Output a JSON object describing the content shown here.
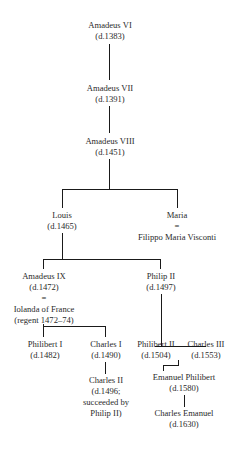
{
  "diagram": {
    "type": "family-tree",
    "nodes": {
      "amadeus_vi": {
        "name": "Amadeus VI",
        "detail": "(d.1383)"
      },
      "amadeus_vii": {
        "name": "Amadeus VII",
        "detail": "(d.1391)"
      },
      "amadeus_viii": {
        "name": "Amadeus VIII",
        "detail": "(d.1451)"
      },
      "louis": {
        "name": "Louis",
        "detail": "(d.1465)"
      },
      "maria": {
        "name": "Maria",
        "marriage": "=",
        "spouse": "Filippo Maria Visconti"
      },
      "amadeus_ix": {
        "name": "Amadeus IX",
        "detail": "(d.1472)",
        "marriage": "=",
        "spouse": "Iolanda of France",
        "spouse_detail": "(regent 1472–74)"
      },
      "philip_ii": {
        "name": "Philip II",
        "detail": "(d.1497)"
      },
      "philibert_i": {
        "name": "Philibert I",
        "detail": "(d.1482)"
      },
      "charles_i": {
        "name": "Charles I",
        "detail": "(d.1490)"
      },
      "charles_ii": {
        "name": "Charles II",
        "detail": "(d.1496;",
        "detail2": "succeeded by",
        "detail3": "Philip II)"
      },
      "philibert_ii": {
        "name": "Philibert II",
        "detail": "(d.1504)"
      },
      "charles_iii": {
        "name": "Charles III",
        "detail": "(d.1553)"
      },
      "emanuel_philibert": {
        "name": "Emanuel Philibert",
        "detail": "(d.1580)"
      },
      "charles_emanuel": {
        "name": "Charles Emanuel",
        "detail": "(d.1630)"
      }
    },
    "edges": [
      [
        "amadeus_vi",
        "amadeus_vii"
      ],
      [
        "amadeus_vii",
        "amadeus_viii"
      ],
      [
        "amadeus_viii",
        "louis"
      ],
      [
        "amadeus_viii",
        "maria"
      ],
      [
        "louis",
        "amadeus_ix"
      ],
      [
        "louis",
        "philip_ii"
      ],
      [
        "amadeus_ix",
        "philibert_i"
      ],
      [
        "amadeus_ix",
        "charles_i"
      ],
      [
        "charles_i",
        "charles_ii"
      ],
      [
        "philip_ii",
        "philibert_ii"
      ],
      [
        "philip_ii",
        "charles_iii"
      ],
      [
        "charles_iii",
        "emanuel_philibert"
      ],
      [
        "emanuel_philibert",
        "charles_emanuel"
      ]
    ]
  }
}
